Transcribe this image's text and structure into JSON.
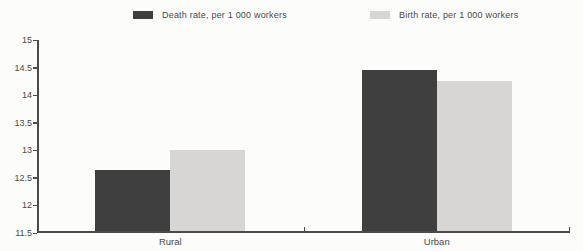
{
  "page": {
    "background": "#fcfcfb"
  },
  "legend": {
    "items": [
      {
        "label": "Death rate, per 1 000 workers",
        "color": "#3f3f3f"
      },
      {
        "label": "Birth rate, per 1 000 workers",
        "color": "#d7d6d4"
      }
    ]
  },
  "chart_data": {
    "type": "bar",
    "categories": [
      "Rural",
      "Urban"
    ],
    "series": [
      {
        "name": "Death rate, per 1 000 workers",
        "color": "#3f3f3f",
        "values": [
          12.65,
          14.45
        ]
      },
      {
        "name": "Birth rate, per 1 000 workers",
        "color": "#d7d6d4",
        "values": [
          13.0,
          14.25
        ]
      }
    ],
    "title": "",
    "xlabel": "",
    "ylabel": "",
    "ylim": [
      11.5,
      15
    ],
    "ytick_step": 0.5,
    "yticks": [
      "11.5",
      "12",
      "12.5",
      "13",
      "13.5",
      "14",
      "14.5",
      "15"
    ],
    "grid": false,
    "legend_position": "top",
    "axis_color": "#4b4b4b",
    "text_color": "#4a4a4a"
  }
}
